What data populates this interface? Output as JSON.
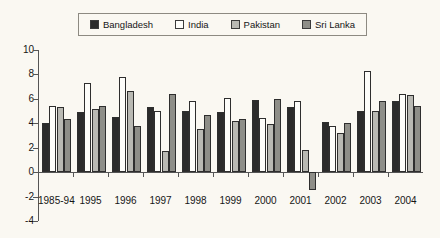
{
  "chart_data": {
    "type": "bar",
    "title": "",
    "xlabel": "",
    "ylabel": "",
    "ylim": [
      -4,
      10
    ],
    "yticks": [
      10,
      8,
      6,
      4,
      2,
      0,
      -2,
      -4
    ],
    "grid": false,
    "legend_position": "top",
    "categories": [
      "1985-94",
      "1995",
      "1996",
      "1997",
      "1998",
      "1999",
      "2000",
      "2001",
      "2002",
      "2003",
      "2004"
    ],
    "series": [
      {
        "name": "Bangladesh",
        "color": "#2b2b2b",
        "values": [
          4.0,
          4.9,
          4.5,
          5.3,
          5.0,
          4.9,
          5.9,
          5.3,
          4.1,
          5.0,
          5.8
        ]
      },
      {
        "name": "India",
        "color": "#fdfdfa",
        "values": [
          5.4,
          7.3,
          7.8,
          5.0,
          5.8,
          6.1,
          4.4,
          5.8,
          3.8,
          8.3,
          6.4
        ]
      },
      {
        "name": "Pakistan",
        "color": "#b9b9b3",
        "values": [
          5.3,
          5.2,
          6.6,
          1.7,
          3.5,
          4.2,
          3.9,
          1.8,
          3.2,
          5.0,
          6.3
        ]
      },
      {
        "name": "Sri Lanka",
        "color": "#8e8e88",
        "values": [
          4.3,
          5.4,
          3.8,
          6.4,
          4.7,
          4.3,
          6.0,
          -1.5,
          4.0,
          5.8,
          5.4
        ]
      }
    ]
  },
  "legend": {
    "items": [
      {
        "label": "Bangladesh",
        "swatch": "legend-swatch-bangladesh"
      },
      {
        "label": "India",
        "swatch": "legend-swatch-india"
      },
      {
        "label": "Pakistan",
        "swatch": "legend-swatch-pakistan"
      },
      {
        "label": "Sri Lanka",
        "swatch": "legend-swatch-sri-lanka"
      }
    ]
  }
}
